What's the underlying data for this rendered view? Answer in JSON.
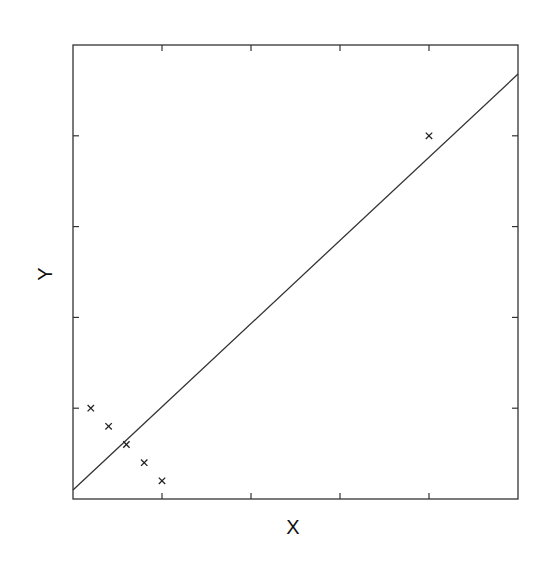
{
  "chart_data": {
    "type": "scatter",
    "title": "",
    "xlabel": "X",
    "ylabel": "Y",
    "xlim": [
      0,
      5
    ],
    "ylim": [
      0,
      5
    ],
    "x_ticks": [
      0,
      1,
      2,
      3,
      4,
      5
    ],
    "y_ticks": [
      0,
      1,
      2,
      3,
      4,
      5
    ],
    "tick_labels_visible": false,
    "grid": false,
    "legend": null,
    "series": [
      {
        "name": "points",
        "marker": "x",
        "x": [
          0.2,
          0.4,
          0.6,
          0.8,
          1.0,
          4.0
        ],
        "y": [
          1.0,
          0.8,
          0.6,
          0.4,
          0.2,
          4.0
        ]
      },
      {
        "name": "fitted line",
        "type": "line",
        "x": [
          0,
          5
        ],
        "y": [
          0.1,
          4.68
        ]
      }
    ]
  },
  "colors": {
    "axis": "#333333",
    "line": "#333333",
    "marker": "#222222",
    "background": "#ffffff"
  }
}
